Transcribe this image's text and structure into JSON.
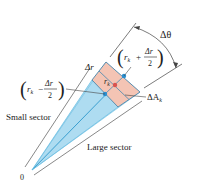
{
  "diagram": {
    "labels": {
      "delta_theta": "Δθ",
      "delta_r": "Δr",
      "outer_radius_r": "r",
      "outer_radius_k": "k",
      "outer_radius_plus": "+",
      "outer_radius_num": "Δr",
      "outer_radius_den": "2",
      "inner_radius_r": "r",
      "inner_radius_k": "k",
      "inner_radius_minus": "−",
      "inner_radius_num": "Δr",
      "inner_radius_den": "2",
      "mid_radius_r": "r",
      "mid_radius_k": "k",
      "delta_area": "ΔA",
      "delta_area_k": "k",
      "small_sector": "Small sector",
      "large_sector": "Large sector",
      "origin": "0"
    },
    "colors": {
      "sector_fill": "#bfe6f5",
      "sector_fill_dark": "#9fd6ee",
      "ray": "#3a9fd0",
      "region_fill": "#f4c4b4",
      "region_stroke": "#5a8fb0",
      "dot_blue": "#2a8fd0",
      "dot_red": "#d9534f",
      "line": "#333333"
    }
  }
}
